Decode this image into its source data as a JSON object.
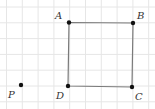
{
  "diagram": {
    "type": "grid-geometry",
    "grid": {
      "spacing_px": 15.8,
      "origin_x": 6.5,
      "origin_y": 7,
      "cols": 10,
      "rows": 7,
      "line_color": "#e6e6e6"
    },
    "shape": {
      "name": "square ABCD",
      "stroke_color": "#7a7a7a",
      "vertices": [
        "A",
        "B",
        "C",
        "D"
      ]
    },
    "points": [
      {
        "id": "A",
        "label": "A",
        "x": 69,
        "y": 22.5,
        "label_x": 55,
        "label_y": 11
      },
      {
        "id": "B",
        "label": "B",
        "x": 133,
        "y": 23,
        "label_x": 137,
        "label_y": 11
      },
      {
        "id": "C",
        "label": "C",
        "x": 132,
        "y": 87,
        "label_x": 135,
        "label_y": 92
      },
      {
        "id": "D",
        "label": "D",
        "x": 68,
        "y": 86,
        "label_x": 56,
        "label_y": 91
      },
      {
        "id": "P",
        "label": "P",
        "x": 21,
        "y": 85,
        "label_x": 8,
        "label_y": 90
      }
    ],
    "point_color": "#111111"
  }
}
